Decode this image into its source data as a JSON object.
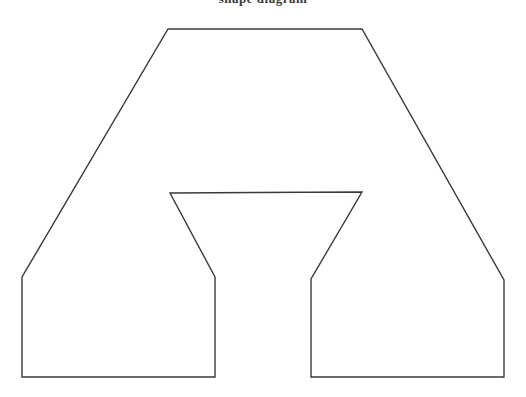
{
  "page": {
    "background_color": "#ffffff",
    "width": 526,
    "height": 397
  },
  "caption": {
    "text": "shape diagram",
    "note": "text is cut off at the very top edge of the screenshot; only the bottom pixels of a few glyphs are visible",
    "color": "#2b2b2b"
  },
  "figure": {
    "name": "arch-outline-shape",
    "stroke_color": "#3a3a3a",
    "fill_color": "#ffffff",
    "stroke_width": 1.4,
    "viewbox": "0 0 526 397",
    "outline_points": "168,29 362,29 504,280 504,377 311,377 311,279 362,192 170,193 215,277 215,377 22,377 22,277",
    "vertices": [
      {
        "name": "top-left",
        "x": 168,
        "y": 29
      },
      {
        "name": "top-right",
        "x": 362,
        "y": 29
      },
      {
        "name": "right-shoulder",
        "x": 504,
        "y": 280
      },
      {
        "name": "right-leg-bottom-right",
        "x": 504,
        "y": 377
      },
      {
        "name": "right-leg-bottom-left",
        "x": 311,
        "y": 377
      },
      {
        "name": "right-leg-inner-top",
        "x": 311,
        "y": 279
      },
      {
        "name": "notch-top-right",
        "x": 362,
        "y": 192
      },
      {
        "name": "notch-top-left",
        "x": 170,
        "y": 193
      },
      {
        "name": "left-leg-inner-top",
        "x": 215,
        "y": 277
      },
      {
        "name": "left-leg-bottom-right",
        "x": 215,
        "y": 377
      },
      {
        "name": "left-leg-bottom-left",
        "x": 22,
        "y": 377
      },
      {
        "name": "left-shoulder",
        "x": 22,
        "y": 277
      }
    ]
  }
}
